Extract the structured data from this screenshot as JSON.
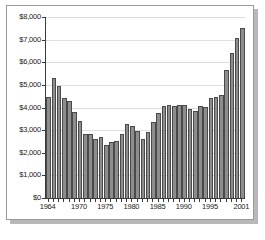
{
  "chart_data": {
    "type": "bar",
    "title": "",
    "subtitle": "",
    "xlabel": "",
    "ylabel": "",
    "ylim": [
      0,
      8000
    ],
    "ytick_step": 1000,
    "grid": true,
    "legend": null,
    "annotations": [],
    "bar_color": "#8d8d8d",
    "bar_border_color": "#4a4a4a",
    "gridline_color": "#dedede",
    "axis_color": "#3a3a3a",
    "background_color": "#ffffff",
    "ytick_labels": [
      "$8,000",
      "$7,000",
      "$6,000",
      "$5,000",
      "$4,000",
      "$3,000",
      "$2,000",
      "$1,000",
      "$0"
    ],
    "ytick_values": [
      8000,
      7000,
      6000,
      5000,
      4000,
      3000,
      2000,
      1000,
      0
    ],
    "xtick_labels": [
      "1964",
      "1970",
      "1975",
      "1980",
      "1985",
      "1990",
      "1995",
      "2001"
    ],
    "xtick_categories": [
      "1964",
      "1970",
      "1975",
      "1980",
      "1985",
      "1990",
      "1995",
      "2001"
    ],
    "categories": [
      "1964",
      "1965",
      "1966",
      "1967",
      "1968",
      "1969",
      "1970",
      "1971",
      "1972",
      "1973",
      "1974",
      "1975",
      "1976",
      "1977",
      "1978",
      "1979",
      "1980",
      "1981",
      "1982",
      "1983",
      "1984",
      "1985",
      "1986",
      "1987",
      "1988",
      "1989",
      "1990",
      "1991",
      "1992",
      "1993",
      "1994",
      "1995",
      "1996",
      "1997",
      "1998",
      "1999",
      "2000",
      "2001"
    ],
    "values": [
      4470,
      5300,
      4930,
      4440,
      4300,
      3800,
      3400,
      2840,
      2850,
      2620,
      2700,
      2360,
      2480,
      2530,
      2830,
      3250,
      3180,
      2980,
      2620,
      2910,
      3380,
      3740,
      4080,
      4100,
      4070,
      4120,
      4130,
      3940,
      3830,
      4080,
      4030,
      4400,
      4470,
      4550,
      5680,
      6390,
      7060,
      7520
    ],
    "last_value": 7700
  }
}
